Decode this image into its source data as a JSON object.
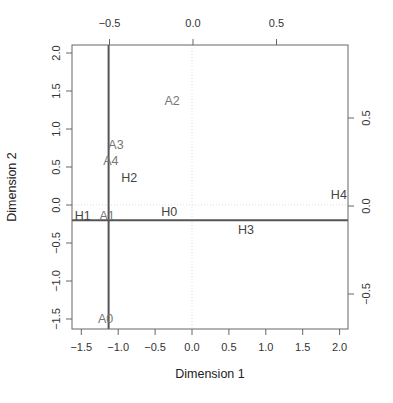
{
  "chart_data": {
    "type": "scatter",
    "title": "",
    "xlabel": "Dimension 1",
    "ylabel": "Dimension 2",
    "xlim": [
      -1.63,
      2.12
    ],
    "ylim": [
      -1.63,
      2.1
    ],
    "grid": false,
    "legend": null,
    "x_ticks": [
      -1.5,
      -1.0,
      -0.5,
      0.0,
      0.5,
      1.0,
      1.5,
      2.0
    ],
    "x_tick_labels": [
      "−1.5",
      "−1.0",
      "−0.5",
      "0.0",
      "0.5",
      "1.0",
      "1.5",
      "2.0"
    ],
    "y_ticks": [
      -1.5,
      -1.0,
      -0.5,
      0.0,
      0.5,
      1.0,
      1.5,
      2.0
    ],
    "y_tick_labels": [
      "−1.5",
      "−1.0",
      "−0.5",
      "0.0",
      "0.5",
      "1.0",
      "1.5",
      "2.0"
    ],
    "secondary_x_axis": {
      "position": "top",
      "ticks": [
        -0.5,
        0.0,
        0.5
      ],
      "tick_labels": [
        "−0.5",
        "0.0",
        "0.5"
      ],
      "pixel_per_unit_ratio": 2.26
    },
    "secondary_y_axis": {
      "position": "right",
      "ticks": [
        -0.5,
        0.0,
        0.5
      ],
      "tick_labels": [
        "−0.5",
        "0.0",
        "0.5"
      ],
      "pixel_per_unit_ratio": 2.34
    },
    "reference_lines": {
      "dotted_zero_x": 0.0,
      "dotted_zero_y": 0.0,
      "solid_vertical_x": -1.13,
      "solid_horizontal_y": -0.2
    },
    "series": [
      {
        "name": "A",
        "color": "#777777",
        "points": [
          {
            "label": "A0",
            "x": -1.17,
            "y": -1.49
          },
          {
            "label": "A1",
            "x": -1.15,
            "y": -0.14
          },
          {
            "label": "A2",
            "x": -0.27,
            "y": 1.37
          },
          {
            "label": "A3",
            "x": -1.03,
            "y": 0.79
          },
          {
            "label": "A4",
            "x": -1.1,
            "y": 0.59
          }
        ]
      },
      {
        "name": "H",
        "color": "#444444",
        "points": [
          {
            "label": "H0",
            "x": -0.31,
            "y": -0.08
          },
          {
            "label": "H1",
            "x": -1.48,
            "y": -0.14
          },
          {
            "label": "H2",
            "x": -0.85,
            "y": 0.36
          },
          {
            "label": "H3",
            "x": 0.73,
            "y": -0.32
          },
          {
            "label": "H4",
            "x": 1.99,
            "y": 0.14
          }
        ]
      }
    ]
  },
  "colors": {
    "axis": "#666666",
    "solid_lines": "#555555",
    "dotted_lines": "#dddddd"
  }
}
